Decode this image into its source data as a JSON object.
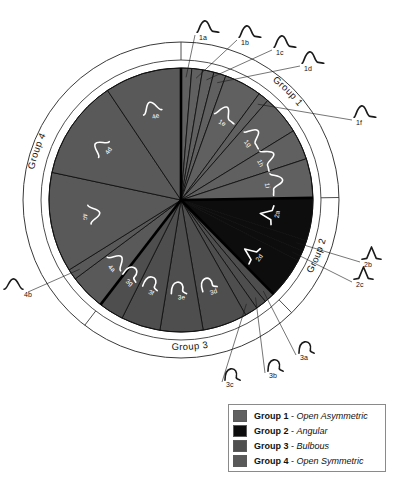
{
  "figure": {
    "type": "pie",
    "title": "",
    "center": {
      "x": 181,
      "y": 200
    },
    "pie_radius": 132,
    "ring_outer_radius": 158,
    "ring_inner_radius": 140,
    "rotation_note": "slice 1a begins at 12 o'clock and proceeds clockwise"
  },
  "colors": {
    "group1": "#606060",
    "group2": "#0d0d0d",
    "group3": "#4e4e4e",
    "group4": "#595959",
    "slice_divider": "#111111",
    "group_divider": "#000000",
    "ring_fill": "#ffffff",
    "ring_stroke": "#3a3a3a",
    "background": "#ffffff",
    "inner_label": "#ffffff",
    "outer_label": "#111111"
  },
  "ring_labels": [
    {
      "text": "Group 1",
      "mid_angle_deg": 48
    },
    {
      "text": "Group 2",
      "mid_angle_deg": 122
    },
    {
      "text": "Group 3",
      "mid_angle_deg": 196
    },
    {
      "text": "Group 4",
      "mid_angle_deg": 302
    }
  ],
  "chart_data": {
    "type": "pie",
    "title": "",
    "legend_position": "bottom-right",
    "categories": [
      "1a",
      "1b",
      "1c",
      "1d",
      "1e",
      "1f",
      "1g",
      "1h",
      "1i",
      "2a",
      "2b",
      "2c",
      "2d",
      "3a",
      "3b",
      "3c",
      "3d",
      "3e",
      "3f",
      "3g",
      "4a",
      "4b",
      "4c",
      "4d",
      "4e"
    ],
    "values": [
      3.0,
      3.0,
      3.2,
      3.4,
      10.5,
      3.0,
      11.0,
      8.5,
      11.0,
      12.0,
      3.0,
      3.0,
      11.5,
      3.0,
      3.0,
      3.6,
      12.5,
      12.0,
      11.0,
      7.0,
      10.0,
      3.0,
      28.0,
      28.0,
      21.5
    ],
    "units": "degrees of arc",
    "group_totals_deg": {
      "Group 1": 56.6,
      "Group 2": 29.5,
      "Group 3": 52.1,
      "Group 4": 95.5
    },
    "groups": [
      {
        "id": "group1",
        "name": "Group 1",
        "description": "Open Asymmetric",
        "color": "#606060",
        "slices": [
          {
            "label": "1a",
            "sweep_deg": 3.0,
            "label_placement": "external"
          },
          {
            "label": "1b",
            "sweep_deg": 3.0,
            "label_placement": "external"
          },
          {
            "label": "1c",
            "sweep_deg": 3.2,
            "label_placement": "external"
          },
          {
            "label": "1d",
            "sweep_deg": 3.4,
            "label_placement": "external"
          },
          {
            "label": "1e",
            "sweep_deg": 10.5,
            "label_placement": "internal"
          },
          {
            "label": "1f",
            "sweep_deg": 3.0,
            "label_placement": "external"
          },
          {
            "label": "1g",
            "sweep_deg": 11.0,
            "label_placement": "internal"
          },
          {
            "label": "1h",
            "sweep_deg": 8.5,
            "label_placement": "internal"
          },
          {
            "label": "1i",
            "sweep_deg": 11.0,
            "label_placement": "internal"
          }
        ]
      },
      {
        "id": "group2",
        "name": "Group 2",
        "description": "Angular",
        "color": "#0d0d0d",
        "slices": [
          {
            "label": "2a",
            "sweep_deg": 12.0,
            "label_placement": "internal"
          },
          {
            "label": "2b",
            "sweep_deg": 3.0,
            "label_placement": "external"
          },
          {
            "label": "2c",
            "sweep_deg": 3.0,
            "label_placement": "external"
          },
          {
            "label": "2d",
            "sweep_deg": 11.5,
            "label_placement": "internal"
          }
        ]
      },
      {
        "id": "group3",
        "name": "Group 3",
        "description": "Bulbous",
        "color": "#4e4e4e",
        "slices": [
          {
            "label": "3a",
            "sweep_deg": 3.0,
            "label_placement": "external"
          },
          {
            "label": "3b",
            "sweep_deg": 3.0,
            "label_placement": "external"
          },
          {
            "label": "3c",
            "sweep_deg": 3.6,
            "label_placement": "external"
          },
          {
            "label": "3d",
            "sweep_deg": 12.5,
            "label_placement": "internal"
          },
          {
            "label": "3e",
            "sweep_deg": 12.0,
            "label_placement": "internal"
          },
          {
            "label": "3f",
            "sweep_deg": 11.0,
            "label_placement": "internal"
          },
          {
            "label": "3g",
            "sweep_deg": 7.0,
            "label_placement": "internal"
          }
        ]
      },
      {
        "id": "group4",
        "name": "Group 4",
        "description": "Open Symmetric",
        "color": "#595959",
        "slices": [
          {
            "label": "4a",
            "sweep_deg": 10.0,
            "label_placement": "internal"
          },
          {
            "label": "4b",
            "sweep_deg": 3.0,
            "label_placement": "external"
          },
          {
            "label": "4c",
            "sweep_deg": 28.0,
            "label_placement": "internal"
          },
          {
            "label": "4d",
            "sweep_deg": 28.0,
            "label_placement": "internal"
          },
          {
            "label": "4e",
            "sweep_deg": 21.5,
            "label_placement": "internal"
          }
        ]
      }
    ]
  },
  "legend": {
    "items": [
      {
        "swatch_color": "#606060",
        "name": "Group 1",
        "separator": " - ",
        "description": "Open Asymmetric"
      },
      {
        "swatch_color": "#0d0d0d",
        "name": "Group 2",
        "separator": " - ",
        "description": "Angular"
      },
      {
        "swatch_color": "#4e4e4e",
        "name": "Group 3",
        "separator": " - ",
        "description": "Bulbous"
      },
      {
        "swatch_color": "#595959",
        "name": "Group 4",
        "separator": " - ",
        "description": "Open Symmetric"
      }
    ]
  }
}
